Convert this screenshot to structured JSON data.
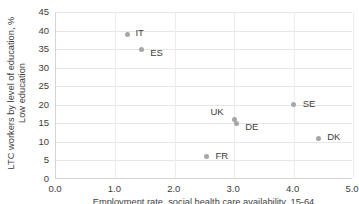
{
  "chart_data": {
    "type": "scatter",
    "title": "",
    "xlabel": "Employment rate, social health care availability, 15-64",
    "ylabel": "LTC workers by level of education, % Low education",
    "xlim": [
      0.0,
      5.0
    ],
    "ylim": [
      0,
      45
    ],
    "xticks": [
      "0.0",
      "1.0",
      "2.0",
      "3.0",
      "4.0",
      "5.0"
    ],
    "xtick_values": [
      0.0,
      1.0,
      2.0,
      3.0,
      4.0,
      5.0
    ],
    "yticks": [
      "0",
      "5",
      "10",
      "15",
      "20",
      "25",
      "30",
      "35",
      "40",
      "45"
    ],
    "ytick_values": [
      0,
      5,
      10,
      15,
      20,
      25,
      30,
      35,
      40,
      45
    ],
    "grid": "horizontal-and-vertical",
    "legend": "none",
    "marker_color": "#a6a6a6",
    "gridline_color": "#e6e6e6",
    "axis_color": "#d4d4d4",
    "points": [
      {
        "label": "IT",
        "x": 1.22,
        "y": 39.0,
        "label_dx": 8,
        "label_dy": -6
      },
      {
        "label": "ES",
        "x": 1.45,
        "y": 35.0,
        "label_dx": 9,
        "label_dy": -1
      },
      {
        "label": "UK",
        "x": 3.02,
        "y": 16.0,
        "label_dx": -24,
        "label_dy": -13
      },
      {
        "label": "DE",
        "x": 3.05,
        "y": 15.0,
        "label_dx": 9,
        "label_dy": -1
      },
      {
        "label": "SE",
        "x": 4.02,
        "y": 20.0,
        "label_dx": 9,
        "label_dy": -6
      },
      {
        "label": "DK",
        "x": 4.43,
        "y": 11.0,
        "label_dx": 9,
        "label_dy": -6
      },
      {
        "label": "FR",
        "x": 2.55,
        "y": 6.0,
        "label_dx": 9,
        "label_dy": -6
      }
    ]
  }
}
